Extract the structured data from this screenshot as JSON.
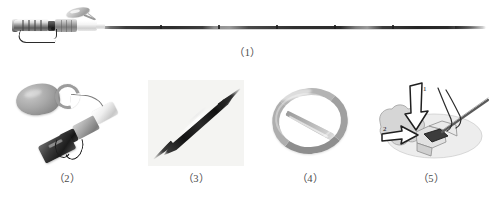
{
  "figure": {
    "type": "medical-device-figure-plate",
    "background_color": "#ffffff",
    "panel_count": 5,
    "panels": [
      {
        "id": "panel-1",
        "caption": "（1）",
        "subject": "complete needle-and-catheter assembly",
        "description": "Full-length view of a long thin tapered needle shaft with proximal metal barrel, dark coupler, grey grip, white luer hub, oval wing paddle and a small wire loop"
      },
      {
        "id": "panel-2",
        "caption": "（2）",
        "subject": "hub and paddle close-up",
        "description": "Close-up of the oval paddle with C-shaped clip, connecting cord, white and grey hubs, and a dark ribbed body with wire loop"
      },
      {
        "id": "panel-3",
        "caption": "（3）",
        "subject": "needle tip close-up",
        "description": "Dark diagonal needle with bright metallic highlight tapering to a sharp point"
      },
      {
        "id": "panel-4",
        "caption": "（4）",
        "subject": "coiled catheter tubing",
        "description": "Grey flexible tube coiled into a single loop with a free straight tail"
      },
      {
        "id": "panel-5",
        "caption": "（5）",
        "subject": "insertion technique illustration",
        "description": "Line drawing of anatomy with a hand and instrument, annotated with two numbered directional arrows",
        "annotations": [
          {
            "label": "1",
            "meaning": "first arrow direction"
          },
          {
            "label": "2",
            "meaning": "second arrow direction"
          }
        ]
      }
    ],
    "colors": {
      "caption_text": "#4a4a4a",
      "metal_light": "#dcdcdc",
      "metal_mid": "#9a9a9a",
      "metal_dark": "#2e2e2e",
      "illustration_line": "#333333",
      "illustration_fill": "#d8d8d8",
      "panel3_background": "#f4f4f2"
    }
  }
}
